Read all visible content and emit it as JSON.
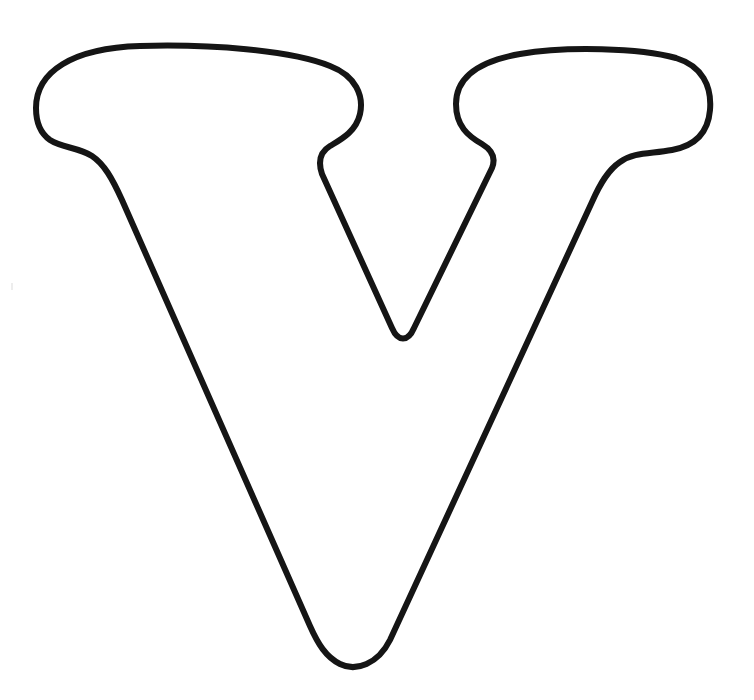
{
  "page": {
    "kind": "coloring-page",
    "background_color": "#ffffff",
    "width": 754,
    "height": 700
  },
  "artwork": {
    "name": "letter-v-outline",
    "description": "Bubble outline of the capital letter V with slab serifs",
    "character": "V",
    "style": "outline",
    "fill_color": "#ffffff",
    "stroke_color": "#151515",
    "stroke_width": 6,
    "outline_path": "M 36 108 C 36 72, 72 48, 140 46 C 210 44, 290 50, 330 66 C 356 76, 364 96, 360 114 C 356 132, 340 140, 330 146 C 320 152, 318 162, 322 174 L 392 328 C 398 342, 408 342, 414 328 L 492 168 C 496 158, 492 150, 482 144 C 468 136, 456 126, 456 104 C 456 80, 474 62, 520 54 C 566 46, 640 48, 676 58 C 702 66, 712 86, 710 110 C 708 134, 694 146, 672 150 C 650 154, 634 152, 620 162 C 608 170, 600 184, 592 202 L 390 640 C 378 664, 356 672, 340 664 C 326 657, 318 644, 310 626 L 122 200 C 112 178, 104 164, 92 156 C 78 147, 62 148, 50 140 C 40 133, 36 122, 36 108 Z"
  },
  "marks": [
    {
      "name": "scan-speck",
      "x": 11,
      "y": 283,
      "color": "#ededed"
    }
  ]
}
